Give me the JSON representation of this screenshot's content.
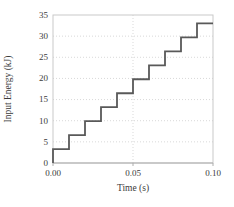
{
  "chart_data": {
    "type": "line",
    "subtype": "step",
    "title": "",
    "xlabel": "Time (s)",
    "ylabel": "Input Energy (kJ)",
    "xlim": [
      0,
      0.1
    ],
    "ylim": [
      0,
      35
    ],
    "xticks": {
      "values": [
        0,
        0.05,
        0.1
      ],
      "labels": [
        "0.00",
        "0.05",
        "0.10"
      ]
    },
    "yticks": {
      "values": [
        0,
        5,
        10,
        15,
        20,
        25,
        30,
        35
      ],
      "labels": [
        "0",
        "5",
        "10",
        "15",
        "20",
        "25",
        "30",
        "35"
      ]
    },
    "grid": {
      "horizontal_at": [
        5,
        10,
        15,
        20,
        25,
        30
      ],
      "vertical_at": [
        0.05
      ],
      "style": "dotted",
      "border": true
    },
    "legend": "none",
    "series": [
      {
        "name": "Input Energy",
        "start": {
          "x": 0,
          "y": 0
        },
        "step_width": 0.01,
        "step_levels": [
          3.3,
          6.6,
          9.9,
          13.2,
          16.5,
          19.8,
          23.1,
          26.4,
          29.7,
          33.0
        ],
        "color": "#595959",
        "line_width": 1.8
      }
    ],
    "colors": {
      "axis_line": "#aeaeae",
      "plot_border": "#c9c9c9",
      "gridline": "#d9d9d9",
      "text": "#3b3b3b",
      "background": "#ffffff"
    }
  }
}
